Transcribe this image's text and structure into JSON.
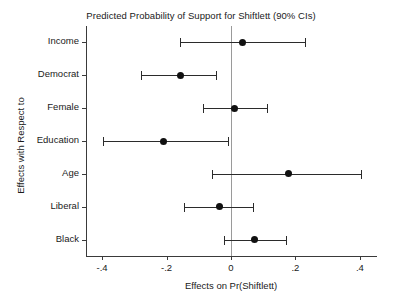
{
  "chart_data": {
    "type": "scatter",
    "title": "Predicted Probability of Support for Shiftlett (90% CIs)",
    "xlabel": "Effects on Pr(Shiftlett)",
    "ylabel": "Effects with Respect to",
    "xlim": [
      -0.45,
      0.45
    ],
    "xticks": [
      -0.4,
      -0.2,
      0,
      0.2,
      0.4
    ],
    "xtick_labels": [
      "-.4",
      "-.2",
      "0",
      ".2",
      ".4"
    ],
    "grid": false,
    "legend": null,
    "reference_line": 0,
    "confidence_level": "90%",
    "categories": [
      "Income",
      "Democrat",
      "Female",
      "Education",
      "Age",
      "Liberal",
      "Black"
    ],
    "values": [
      0.037,
      -0.157,
      0.011,
      -0.21,
      0.177,
      -0.037,
      0.074
    ],
    "ci_low": [
      -0.157,
      -0.28,
      -0.086,
      -0.397,
      -0.06,
      -0.146,
      -0.023
    ],
    "ci_high": [
      0.231,
      -0.046,
      0.111,
      -0.009,
      0.403,
      0.069,
      0.171
    ],
    "points": [
      {
        "label": "Income",
        "estimate": 0.037,
        "ci_low": -0.157,
        "ci_high": 0.231
      },
      {
        "label": "Democrat",
        "estimate": -0.157,
        "ci_low": -0.28,
        "ci_high": -0.046
      },
      {
        "label": "Female",
        "estimate": 0.011,
        "ci_low": -0.086,
        "ci_high": 0.111
      },
      {
        "label": "Education",
        "estimate": -0.21,
        "ci_low": -0.397,
        "ci_high": -0.009
      },
      {
        "label": "Age",
        "estimate": 0.177,
        "ci_low": -0.06,
        "ci_high": 0.403
      },
      {
        "label": "Liberal",
        "estimate": -0.037,
        "ci_low": -0.146,
        "ci_high": 0.069
      },
      {
        "label": "Black",
        "estimate": 0.074,
        "ci_low": -0.023,
        "ci_high": 0.171
      }
    ],
    "colors": {
      "point": "#111111",
      "ci": "#2b2b2b",
      "axis": "#3a3a3a",
      "reference": "#9a9a9a",
      "background": "#ffffff"
    }
  }
}
